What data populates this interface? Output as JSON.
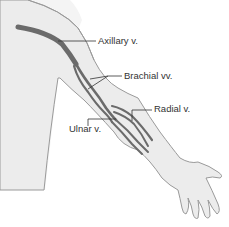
{
  "figure": {
    "colors": {
      "background": "#ffffff",
      "arm_fill": "#ececec",
      "arm_outline": "#9a9a9a",
      "vein": "#6b6b6b",
      "leader_line": "#333333",
      "label_text": "#333333"
    },
    "labels": [
      {
        "id": "axillary",
        "text": "Axillary v."
      },
      {
        "id": "brachial",
        "text": "Brachial vv."
      },
      {
        "id": "radial",
        "text": "Radial v."
      },
      {
        "id": "ulnar",
        "text": "Ulnar v."
      }
    ]
  }
}
